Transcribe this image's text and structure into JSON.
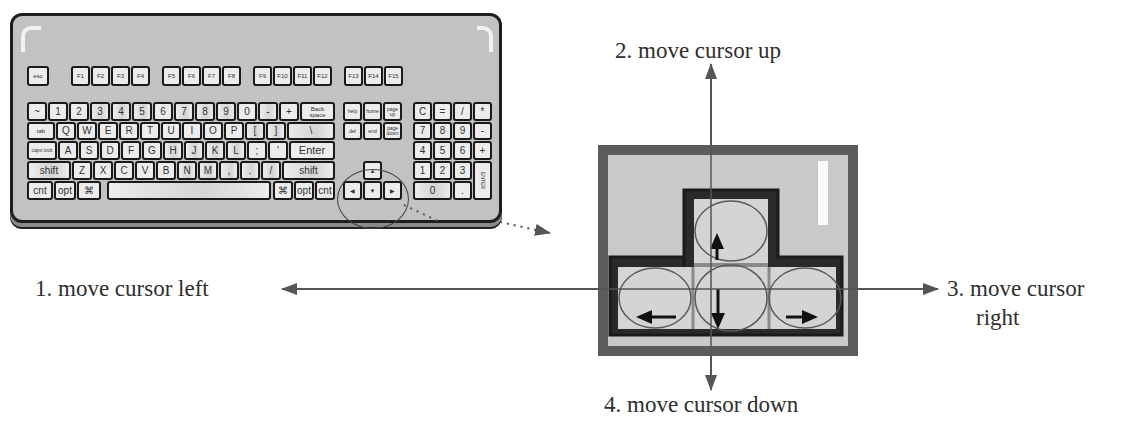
{
  "diagram": {
    "type": "keyboard-arrow-keys-explainer",
    "labels": {
      "left": "1. move cursor left",
      "up": "2. move cursor up",
      "right_line1": "3. move cursor",
      "right_line2": "right",
      "down": "4. move cursor down"
    },
    "keyboard": {
      "function_row": [
        "esc",
        "F1",
        "F2",
        "F3",
        "F4",
        "F5",
        "F6",
        "F7",
        "F8",
        "F9",
        "F10",
        "F11",
        "F12",
        "F13",
        "F14",
        "F15"
      ],
      "number_row": [
        "~",
        "1",
        "2",
        "3",
        "4",
        "5",
        "6",
        "7",
        "8",
        "9",
        "0",
        "-",
        "+",
        "Back space"
      ],
      "qwerty_row": [
        "tab",
        "Q",
        "W",
        "E",
        "R",
        "T",
        "U",
        "I",
        "O",
        "P",
        "[",
        "]",
        "\\"
      ],
      "home_row": [
        "caps lock",
        "A",
        "S",
        "D",
        "F",
        "G",
        "H",
        "J",
        "K",
        "L",
        ";",
        "'",
        "Enter"
      ],
      "shift_row": [
        "shift",
        "Z",
        "X",
        "C",
        "V",
        "B",
        "N",
        "M",
        ",",
        ".",
        "/",
        "shift"
      ],
      "bottom_row": [
        "cnt",
        "opt",
        "⌘",
        "",
        "⌘",
        "opt",
        "cnt"
      ],
      "nav_cluster": [
        "help",
        "home",
        "page up",
        "del",
        "end",
        "page down"
      ],
      "arrow_keys": [
        "▲",
        "◀",
        "▼",
        "▶"
      ],
      "numpad": [
        "C",
        "=",
        "/",
        "*",
        "7",
        "8",
        "9",
        "-",
        "4",
        "5",
        "6",
        "+",
        "1",
        "2",
        "3",
        "ENTER",
        "0",
        "."
      ]
    },
    "zoom_panel": {
      "arrows": [
        "up-arrow",
        "left-arrow",
        "down-arrow",
        "right-arrow"
      ]
    },
    "colors": {
      "line": "#555555",
      "panel_border": "#5c5c5c",
      "panel_fill": "#c9c9c9",
      "key_fill": "#dcdcdc",
      "text": "#2e2e2e"
    }
  }
}
